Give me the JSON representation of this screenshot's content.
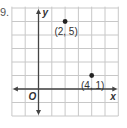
{
  "problem": {
    "number_fragment": "9."
  },
  "chart_data": {
    "type": "scatter",
    "title": "",
    "xlabel": "x",
    "ylabel": "y",
    "origin_label": "O",
    "xlim": [
      -2,
      6
    ],
    "ylim": [
      -2,
      6
    ],
    "grid": true,
    "points": [
      {
        "x": 2,
        "y": 5,
        "label": "(2, 5)"
      },
      {
        "x": 4,
        "y": 1,
        "label": "(4, 1)"
      }
    ]
  },
  "colors": {
    "grid": "#c8c8c8",
    "axis": "#444444",
    "point": "#222222",
    "text": "#333333"
  }
}
